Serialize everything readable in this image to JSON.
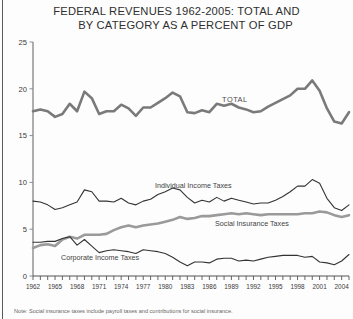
{
  "title": {
    "line1": "FEDERAL REVENUES 1962-2005: TOTAL AND",
    "line2": "BY CATEGORY AS A PERCENT OF GDP"
  },
  "note": "Note: Social insurance taxes include payroll taxes and contributions for social insurance.",
  "colors": {
    "total_line": "#7a7a7a",
    "social_line": "#9a9a9a",
    "thin_line": "#333333",
    "axis": "#8c8c8c",
    "text": "#3a3a3a"
  },
  "annotations": {
    "total": "TOTAL",
    "individual": "Individual Income Taxes",
    "social": "Social Insurance Taxes",
    "corporate": "Corporate Income Taxes"
  },
  "chart_data": {
    "type": "line",
    "title": "FEDERAL REVENUES 1962-2005: TOTAL AND BY CATEGORY AS A PERCENT OF GDP",
    "xlabel": "",
    "ylabel": "",
    "ylim": [
      0,
      25
    ],
    "yticks": [
      0,
      5,
      10,
      15,
      20,
      25
    ],
    "xlim": [
      1962,
      2005
    ],
    "xticks": [
      1962,
      1965,
      1968,
      1971,
      1974,
      1977,
      1980,
      1983,
      1986,
      1989,
      1992,
      1995,
      1998,
      2001,
      2004
    ],
    "grid": false,
    "legend": "inline-annotations",
    "x": [
      1962,
      1963,
      1964,
      1965,
      1966,
      1967,
      1968,
      1969,
      1970,
      1971,
      1972,
      1973,
      1974,
      1975,
      1976,
      1977,
      1978,
      1979,
      1980,
      1981,
      1982,
      1983,
      1984,
      1985,
      1986,
      1987,
      1988,
      1989,
      1990,
      1991,
      1992,
      1993,
      1994,
      1995,
      1996,
      1997,
      1998,
      1999,
      2000,
      2001,
      2002,
      2003,
      2004,
      2005
    ],
    "series": [
      {
        "name": "TOTAL",
        "style": "thick-gray",
        "values": [
          17.6,
          17.8,
          17.6,
          17.0,
          17.3,
          18.4,
          17.6,
          19.7,
          19.0,
          17.3,
          17.6,
          17.6,
          18.3,
          17.9,
          17.1,
          18.0,
          18.0,
          18.5,
          19.0,
          19.6,
          19.2,
          17.5,
          17.4,
          17.7,
          17.5,
          18.4,
          18.2,
          18.4,
          18.0,
          17.8,
          17.5,
          17.6,
          18.1,
          18.5,
          18.9,
          19.3,
          20.0,
          20.0,
          20.9,
          19.8,
          17.9,
          16.5,
          16.3,
          17.5
        ]
      },
      {
        "name": "Individual Income Taxes",
        "style": "thin-dark",
        "values": [
          8.0,
          7.9,
          7.6,
          7.1,
          7.3,
          7.6,
          7.9,
          9.2,
          9.0,
          8.0,
          8.0,
          7.9,
          8.3,
          7.8,
          7.6,
          8.0,
          8.2,
          8.7,
          9.0,
          9.4,
          9.2,
          8.4,
          7.8,
          8.1,
          7.9,
          8.4,
          8.0,
          8.3,
          8.1,
          7.9,
          7.7,
          7.8,
          7.8,
          8.1,
          8.5,
          9.0,
          9.6,
          9.6,
          10.3,
          9.9,
          8.3,
          7.3,
          7.0,
          7.6
        ]
      },
      {
        "name": "Social Insurance Taxes",
        "style": "thick-gray",
        "values": [
          3.0,
          3.3,
          3.4,
          3.2,
          3.9,
          4.2,
          4.0,
          4.4,
          4.4,
          4.4,
          4.5,
          4.9,
          5.2,
          5.4,
          5.2,
          5.4,
          5.5,
          5.6,
          5.8,
          6.0,
          6.3,
          6.1,
          6.2,
          6.4,
          6.4,
          6.5,
          6.6,
          6.7,
          6.6,
          6.7,
          6.6,
          6.5,
          6.6,
          6.6,
          6.6,
          6.6,
          6.6,
          6.7,
          6.7,
          6.9,
          6.8,
          6.5,
          6.3,
          6.5
        ]
      },
      {
        "name": "Corporate Income Taxes",
        "style": "thin-dark",
        "values": [
          3.6,
          3.6,
          3.7,
          3.7,
          4.0,
          4.2,
          3.3,
          3.9,
          3.2,
          2.5,
          2.7,
          2.8,
          2.7,
          2.6,
          2.4,
          2.8,
          2.7,
          2.6,
          2.4,
          2.0,
          1.5,
          1.1,
          1.5,
          1.5,
          1.4,
          1.8,
          1.9,
          1.9,
          1.6,
          1.7,
          1.6,
          1.8,
          2.0,
          2.1,
          2.2,
          2.2,
          2.2,
          2.0,
          2.1,
          1.5,
          1.4,
          1.2,
          1.6,
          2.3
        ]
      }
    ]
  }
}
